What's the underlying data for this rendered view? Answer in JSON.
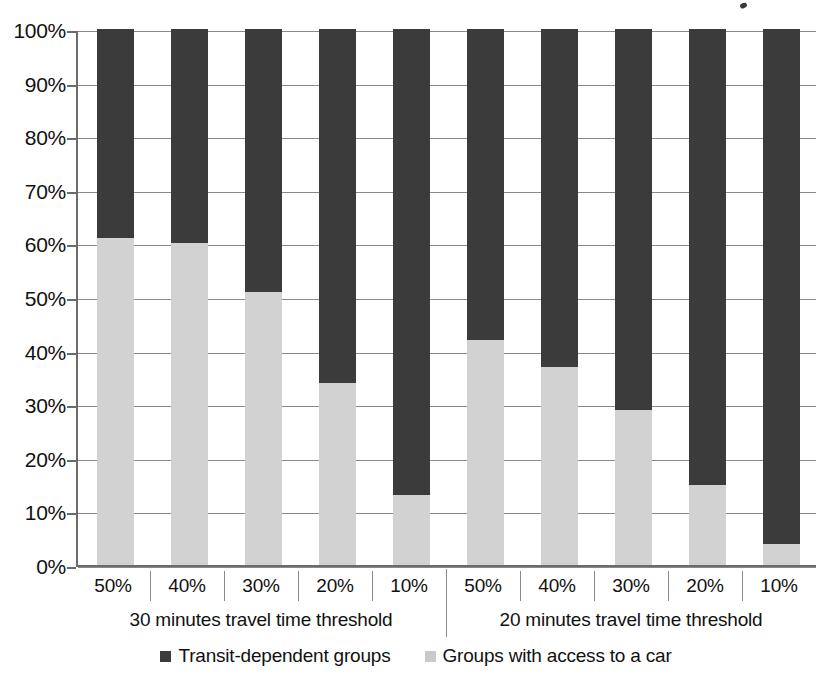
{
  "chart_data": {
    "type": "bar",
    "subtype": "stacked-percentage",
    "title": "",
    "subtitle": "",
    "xlabel": "",
    "ylabel": "",
    "ylim": [
      0,
      100
    ],
    "y_tick_labels": [
      "100%",
      "90%",
      "80%",
      "70%",
      "60%",
      "50%",
      "40%",
      "30%",
      "20%",
      "10%",
      "0%"
    ],
    "y_tick_values": [
      100,
      90,
      80,
      70,
      60,
      50,
      40,
      30,
      20,
      10,
      0
    ],
    "grid": true,
    "legend_position": "bottom",
    "categories": [
      "50%",
      "40%",
      "30%",
      "20%",
      "10%",
      "50%",
      "40%",
      "30%",
      "20%",
      "10%"
    ],
    "groups": [
      {
        "label": "30 minutes travel time threshold",
        "categories": [
          "50%",
          "40%",
          "30%",
          "20%",
          "10%"
        ]
      },
      {
        "label": "20 minutes travel time threshold",
        "categories": [
          "50%",
          "40%",
          "30%",
          "20%",
          "10%"
        ]
      }
    ],
    "series": [
      {
        "name": "Groups with access to a car",
        "color": "#d2d2d2",
        "values": [
          61,
          60,
          51,
          34,
          13,
          42,
          37,
          29,
          15,
          4
        ]
      },
      {
        "name": "Transit-dependent groups",
        "color": "#3b3b3b",
        "values": [
          39,
          40,
          49,
          66,
          87,
          58,
          63,
          71,
          85,
          96
        ]
      }
    ],
    "legend": [
      {
        "label": "Transit-dependent groups",
        "swatch": "dark-square-icon",
        "color": "#3b3b3b"
      },
      {
        "label": "Groups with access to a car",
        "swatch": "light-square-icon",
        "color": "#c9c9c9"
      }
    ],
    "colors": {
      "transit_dependent": "#3b3b3b",
      "car_access": "#d2d2d2",
      "gridline": "#8a8a8a",
      "axis": "#6b6b6b",
      "text": "#111111",
      "background": "#ffffff"
    }
  }
}
